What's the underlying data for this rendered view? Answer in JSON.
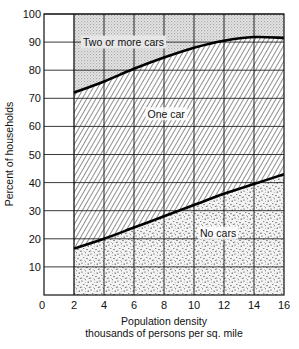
{
  "chart_data": {
    "type": "area",
    "title": "",
    "xlabel": "Population density",
    "xlabel_sub": "thousands of persons per sq. mile",
    "ylabel": "Percent of households",
    "xlim": [
      0,
      16
    ],
    "ylim": [
      0,
      100
    ],
    "x_ticks": [
      0,
      2,
      4,
      6,
      8,
      10,
      12,
      14,
      16
    ],
    "y_ticks": [
      10,
      20,
      30,
      40,
      50,
      60,
      70,
      80,
      90,
      100
    ],
    "grid": true,
    "stacked": true,
    "x": [
      2,
      4,
      6,
      8,
      10,
      12,
      14,
      16
    ],
    "boundaries": [
      {
        "name": "No cars / One car boundary",
        "values": [
          16.5,
          20,
          24,
          28,
          32,
          36,
          39.5,
          43
        ]
      },
      {
        "name": "One car / Two or more cars boundary",
        "values": [
          72,
          76,
          80.5,
          84.5,
          88,
          90.5,
          91.8,
          91.5
        ]
      }
    ],
    "series": [
      {
        "name": "No cars",
        "values": [
          16.5,
          20,
          24,
          28,
          32,
          36,
          39.5,
          43
        ],
        "fill": "stipple"
      },
      {
        "name": "One car",
        "values": [
          55.5,
          56,
          56.5,
          56.5,
          56,
          54.5,
          52.3,
          48.5
        ],
        "fill": "diagonal-hatch"
      },
      {
        "name": "Two or more cars",
        "values": [
          28,
          24,
          19.5,
          15.5,
          12,
          9.5,
          8.2,
          8.5
        ],
        "fill": "light-gray-screen"
      }
    ],
    "annotations": [
      {
        "text": "Two or more cars",
        "x": 2.6,
        "y": 90
      },
      {
        "text": "One car",
        "x": 6.9,
        "y": 64.5
      },
      {
        "text": "No cars",
        "x": 10.4,
        "y": 22
      }
    ]
  },
  "colors": {
    "ink": "#111111",
    "screen_gray": "#d9d9d9",
    "stipple_bg": "#f2f2f2"
  }
}
